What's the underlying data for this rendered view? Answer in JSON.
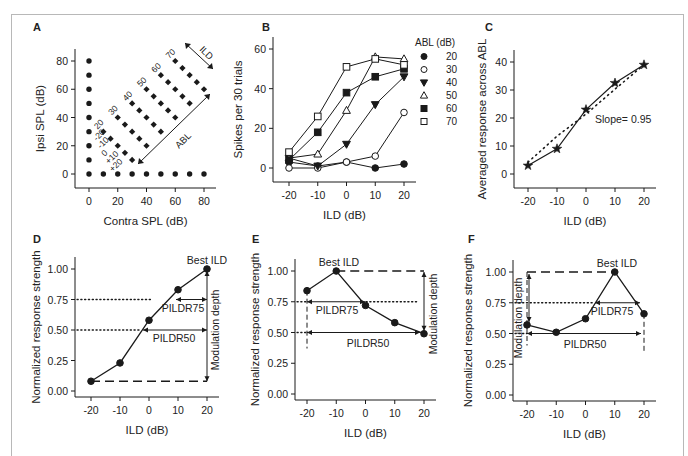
{
  "figure": {
    "frame_color": "#b8b8b8",
    "ink": "#1a1a1a"
  },
  "chart_data": [
    {
      "id": "A",
      "panel_label": "A",
      "type": "scatter",
      "title": "",
      "xlabel": "Contra SPL (dB)",
      "ylabel": "Ipsi SPL (dB)",
      "xlim": [
        0,
        80
      ],
      "ylim": [
        0,
        80
      ],
      "xticks": [
        0,
        20,
        40,
        60,
        80
      ],
      "yticks": [
        0,
        20,
        40,
        60,
        80
      ],
      "monaural_contra_points": [
        [
          0,
          0
        ],
        [
          10,
          0
        ],
        [
          20,
          0
        ],
        [
          30,
          0
        ],
        [
          40,
          0
        ],
        [
          50,
          0
        ],
        [
          60,
          0
        ],
        [
          70,
          0
        ],
        [
          80,
          0
        ]
      ],
      "monaural_ipsi_points": [
        [
          0,
          10
        ],
        [
          0,
          20
        ],
        [
          0,
          30
        ],
        [
          0,
          40
        ],
        [
          0,
          50
        ],
        [
          0,
          60
        ],
        [
          0,
          70
        ],
        [
          0,
          80
        ]
      ],
      "binaural_grid": {
        "abl_values": [
          20,
          30,
          40,
          50,
          60,
          70
        ],
        "ild_values": [
          -20,
          -10,
          0,
          10,
          20
        ],
        "note": "ipsi = ABL - ILD/2, contra = ABL + ILD/2"
      },
      "abl_labels": [
        "20",
        "30",
        "40",
        "50",
        "60",
        "70"
      ],
      "ild_labels": [
        "-20",
        "-10",
        "0",
        "+10",
        "+20"
      ],
      "annotations": [
        "ILD",
        "ABL"
      ],
      "grid": false
    },
    {
      "id": "B",
      "panel_label": "B",
      "type": "line",
      "xlabel": "ILD (dB)",
      "ylabel": "Spikes per 30 trials",
      "x": [
        -20,
        -10,
        0,
        10,
        20
      ],
      "xlim": [
        -20,
        20
      ],
      "ylim": [
        0,
        60
      ],
      "xticks": [
        -20,
        -10,
        0,
        10,
        20
      ],
      "yticks": [
        0,
        20,
        40,
        60
      ],
      "legend_title": "ABL (dB)",
      "legend_position": "right",
      "series": [
        {
          "name": "20",
          "marker": "circle-filled",
          "values": [
            3,
            1,
            3,
            0,
            2
          ]
        },
        {
          "name": "30",
          "marker": "circle-open",
          "values": [
            0,
            0,
            3,
            6,
            28
          ]
        },
        {
          "name": "40",
          "marker": "triangle-down-filled",
          "values": [
            5,
            1,
            12,
            32,
            46
          ]
        },
        {
          "name": "50",
          "marker": "triangle-up-open",
          "values": [
            5,
            7,
            29,
            56,
            55
          ]
        },
        {
          "name": "60",
          "marker": "square-filled",
          "values": [
            4,
            18,
            38,
            46,
            50
          ]
        },
        {
          "name": "70",
          "marker": "square-open",
          "values": [
            8,
            26,
            51,
            55,
            52
          ]
        }
      ],
      "grid": false
    },
    {
      "id": "C",
      "panel_label": "C",
      "type": "line",
      "xlabel": "ILD (dB)",
      "ylabel": "Averaged response across ABL",
      "x": [
        -20,
        -10,
        0,
        10,
        20
      ],
      "xlim": [
        -20,
        20
      ],
      "ylim": [
        0,
        40
      ],
      "xticks": [
        -20,
        -10,
        0,
        10,
        20
      ],
      "yticks": [
        0,
        10,
        20,
        30,
        40
      ],
      "series": [
        {
          "name": "average",
          "marker": "star",
          "values": [
            3,
            9,
            23,
            32.5,
            39
          ]
        },
        {
          "name": "linear fit",
          "style": "dotted",
          "values": [
            4.2,
            13.5,
            21.4,
            30.3,
            39.0
          ]
        }
      ],
      "annotations": [
        "Slope= 0.95"
      ],
      "grid": false
    },
    {
      "id": "D",
      "panel_label": "D",
      "type": "line",
      "xlabel": "ILD (dB)",
      "ylabel": "Normalized response strength",
      "x": [
        -20,
        -10,
        0,
        10,
        20
      ],
      "xlim": [
        -20,
        20
      ],
      "ylim": [
        0,
        1
      ],
      "xticks": [
        -20,
        -10,
        0,
        10,
        20
      ],
      "yticks": [
        "0.00",
        "0.25",
        "0.50",
        "0.75",
        "1.00"
      ],
      "series": [
        {
          "name": "response",
          "marker": "circle-filled",
          "values": [
            0.08,
            0.23,
            0.58,
            0.83,
            1.0
          ]
        }
      ],
      "annotations": [
        "Best ILD",
        "PILDR75",
        "PILDR50",
        "Modulation depth"
      ],
      "reference_lines": [
        0.75,
        0.5
      ],
      "grid": false
    },
    {
      "id": "E",
      "panel_label": "E",
      "type": "line",
      "xlabel": "ILD (dB)",
      "ylabel": "Normalized response strength",
      "x": [
        -20,
        -10,
        0,
        10,
        20
      ],
      "xlim": [
        -20,
        20
      ],
      "ylim": [
        0,
        1
      ],
      "xticks": [
        -20,
        -10,
        0,
        10,
        20
      ],
      "yticks": [
        "0.00",
        "0.25",
        "0.50",
        "0.75",
        "1.00"
      ],
      "series": [
        {
          "name": "response",
          "marker": "circle-filled",
          "values": [
            0.84,
            1.0,
            0.72,
            0.58,
            0.49
          ]
        }
      ],
      "annotations": [
        "Best ILD",
        "PILDR75",
        "PILDR50",
        "Modulation depth"
      ],
      "reference_lines": [
        0.75,
        0.5
      ],
      "grid": false
    },
    {
      "id": "F",
      "panel_label": "F",
      "type": "line",
      "xlabel": "ILD (dB)",
      "ylabel": "Normalized response strength",
      "x": [
        -20,
        -10,
        0,
        10,
        20
      ],
      "xlim": [
        -20,
        20
      ],
      "ylim": [
        0,
        1
      ],
      "xticks": [
        -20,
        -10,
        0,
        10,
        20
      ],
      "yticks": [
        "0.00",
        "0.25",
        "0.50",
        "0.75",
        "1.00"
      ],
      "series": [
        {
          "name": "response",
          "marker": "circle-filled",
          "values": [
            0.57,
            0.51,
            0.62,
            1.0,
            0.66
          ]
        }
      ],
      "annotations": [
        "Best ILD",
        "PILDR75",
        "PILDR50",
        "Modulation depth"
      ],
      "reference_lines": [
        0.75,
        0.5
      ],
      "grid": false
    }
  ],
  "layout": {
    "A": {
      "label_xy": [
        33,
        31
      ],
      "ox": 75,
      "axis_y": 188,
      "x0": 89,
      "x1": 204,
      "y0": 174,
      "y1": 61
    },
    "B": {
      "label_xy": [
        262,
        31
      ],
      "ox": 273,
      "axis_y": 182,
      "x0": 289,
      "x1": 404,
      "y0": 168,
      "y1": 49
    },
    "C": {
      "label_xy": [
        485,
        31
      ],
      "ox": 514,
      "axis_y": 188,
      "x0": 528,
      "x1": 644,
      "y0": 174,
      "y1": 62
    },
    "D": {
      "label_xy": [
        33,
        243
      ],
      "ox": 75,
      "axis_y": 397,
      "x0": 91,
      "x1": 207,
      "y0": 391,
      "y1": 269
    },
    "E": {
      "label_xy": [
        252,
        243
      ],
      "ox": 295,
      "axis_y": 400,
      "x0": 307,
      "x1": 424,
      "y0": 394,
      "y1": 271
    },
    "F": {
      "label_xy": [
        468,
        243
      ],
      "ox": 513,
      "axis_y": 401,
      "x0": 527,
      "x1": 644,
      "y0": 395,
      "y1": 272
    }
  }
}
